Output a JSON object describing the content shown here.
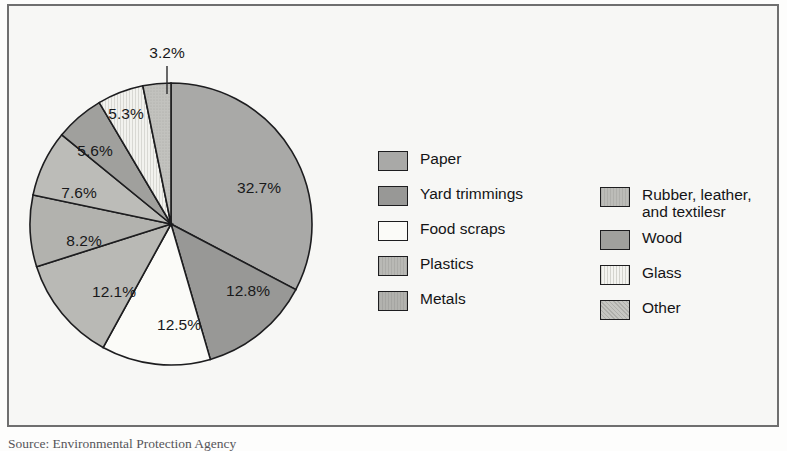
{
  "figure": {
    "source_note": "Source: Environmental Protection Agency",
    "frame_color": "#6f6f6f",
    "background_color": "#f7f7f5"
  },
  "chart_data": {
    "type": "pie",
    "title": "",
    "subtitle": "",
    "xlabel": "",
    "ylabel": "",
    "legend_position": "right",
    "grid": false,
    "start_angle_deg": 0,
    "direction": "clockwise",
    "center": {
      "x": 162,
      "y": 218
    },
    "radius": 141,
    "unit": "%",
    "categories": [
      "Paper",
      "Yard trimmings",
      "Food scraps",
      "Plastics",
      "Metals",
      "Rubber, leather,\nand textilesr",
      "Wood",
      "Glass",
      "Other"
    ],
    "values": [
      32.7,
      12.8,
      12.5,
      12.1,
      8.2,
      7.6,
      5.6,
      5.3,
      3.2
    ],
    "data_labels": [
      "32.7%",
      "12.8%",
      "12.5%",
      "12.1%",
      "8.2%",
      "7.6%",
      "5.6%",
      "5.3%",
      "3.2%"
    ],
    "slice_colors": [
      "#a9a9a7",
      "#989896",
      "#fbfbf8",
      "#b9b9b5",
      "#b2b2ae",
      "#bcbcb8",
      "#a0a09d",
      "#f0f0ec",
      "#c2c2be"
    ],
    "slice_edge_color": "#1d1d1f",
    "label_positions": [
      {
        "label": "32.7%",
        "x": 250,
        "y": 187
      },
      {
        "label": "12.8%",
        "x": 239,
        "y": 290
      },
      {
        "label": "12.5%",
        "x": 170,
        "y": 324
      },
      {
        "label": "12.1%",
        "x": 105,
        "y": 291
      },
      {
        "label": "8.2%",
        "x": 75,
        "y": 240
      },
      {
        "label": "7.6%",
        "x": 70,
        "y": 192
      },
      {
        "label": "5.6%",
        "x": 86,
        "y": 150
      },
      {
        "label": "5.3%",
        "x": 117,
        "y": 113
      },
      {
        "label": "3.2%",
        "x": 158,
        "y": 52
      }
    ],
    "leader_line": {
      "label": "3.2%",
      "x1": 158,
      "y1": 60,
      "x2": 158,
      "y2": 88
    }
  },
  "legend": {
    "columns": [
      {
        "name": "legend-column-left",
        "items": [
          {
            "label": "Paper",
            "color": "#a9a9a7",
            "value": 32.7
          },
          {
            "label": "Yard trimmings",
            "color": "#989896",
            "value": 12.8
          },
          {
            "label": "Food scraps",
            "color": "#fbfbf8",
            "value": 12.5
          },
          {
            "label": "Plastics",
            "color": "#b9b9b5",
            "value": 12.1
          },
          {
            "label": "Metals",
            "color": "#b2b2ae",
            "value": 8.2
          }
        ]
      },
      {
        "name": "legend-column-right",
        "items": [
          {
            "label": "Rubber, leather,\nand textilesr",
            "color": "#bcbcb8",
            "value": 7.6
          },
          {
            "label": "Wood",
            "color": "#a0a09d",
            "value": 5.6
          },
          {
            "label": "Glass",
            "color": "#f0f0ec",
            "value": 5.3
          },
          {
            "label": "Other",
            "color": "#c2c2be",
            "value": 3.2
          }
        ]
      }
    ]
  }
}
